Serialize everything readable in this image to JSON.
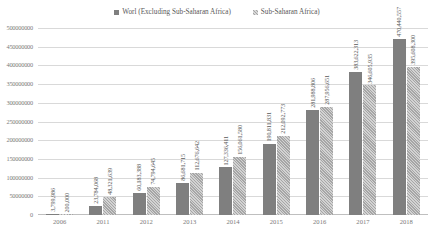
{
  "chart_data": {
    "type": "bar",
    "title": "",
    "xlabel": "",
    "ylabel": "",
    "grid": true,
    "legend_position": "top-center",
    "categories": [
      "2006",
      "2011",
      "2012",
      "2013",
      "2014",
      "2015",
      "2016",
      "2017",
      "2018"
    ],
    "ylim": [
      0,
      500000000
    ],
    "ytick_labels": [
      "500000000",
      "450000000",
      "400000000",
      "350000000",
      "300000000",
      "250000000",
      "200000000",
      "150000000",
      "100000000",
      "50000000",
      "0"
    ],
    "ytick_values": [
      500000000,
      450000000,
      400000000,
      350000000,
      300000000,
      250000000,
      200000000,
      150000000,
      100000000,
      50000000,
      0
    ],
    "series": [
      {
        "name": "Worl (Excluding Sub-Saharan Africa)",
        "color": "#7f7f7f",
        "values": [
          3799986,
          23784068,
          60183388,
          86681715,
          127336411,
          190811831,
          281988806,
          383622313,
          470440557
        ],
        "labels": [
          "3,799,986",
          "23,784,068",
          "60,183,388",
          "86,681,715",
          "127,336,411",
          "190,811,831",
          "281,988,806",
          "383,622,313",
          "470,440,557"
        ]
      },
      {
        "name": "Sub-Saharan Africa)",
        "color": "#a6a6a6",
        "values": [
          200000,
          48321639,
          74794645,
          112676642,
          156061580,
          212092773,
          287956651,
          346605935,
          395608300
        ],
        "labels": [
          "200,000",
          "48,321,639",
          "74,794,645",
          "112,676,642",
          "156,061,580",
          "212,092,773",
          "287,956,651",
          "346,605,935",
          "395,608,300"
        ]
      }
    ]
  }
}
